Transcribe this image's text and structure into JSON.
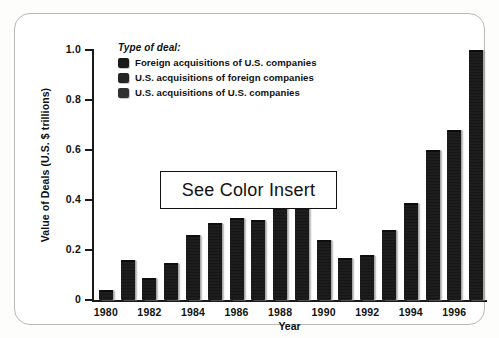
{
  "figure": {
    "legend_title": "Type of deal:",
    "note_overlay": "See Color Insert"
  },
  "legend": {
    "items": [
      {
        "label": "Foreign acquisitions of U.S. companies",
        "swatch": "legend-swatch-foreign-acq-us",
        "color": "#1a1a1a"
      },
      {
        "label": "U.S. acquisitions of foreign companies",
        "swatch": "legend-swatch-us-acq-foreign",
        "color": "#252525"
      },
      {
        "label": "U.S. acquisitions of U.S. companies",
        "swatch": "legend-swatch-us-acq-us",
        "color": "#303030"
      }
    ]
  },
  "chart_data": {
    "type": "bar",
    "title": "",
    "xlabel": "Year",
    "ylabel": "Value of Deals (U.S. $ trillions)",
    "ylim": [
      0,
      1.0
    ],
    "yticks": [
      0,
      0.2,
      0.4,
      0.6,
      0.8,
      1.0
    ],
    "ytick_labels": [
      "0",
      "0.2",
      "0.4",
      "0.6",
      "0.8",
      "1.0"
    ],
    "xtick_labels": [
      "1980",
      "1982",
      "1984",
      "1986",
      "1988",
      "1990",
      "1992",
      "1994",
      "1996"
    ],
    "grid": false,
    "legend_position": "upper-left-inside",
    "categories": [
      "1980",
      "1981",
      "1982",
      "1983",
      "1984",
      "1985",
      "1986",
      "1987",
      "1988",
      "1989",
      "1990",
      "1991",
      "1992",
      "1993",
      "1994",
      "1995",
      "1996",
      "1997"
    ],
    "values": [
      0.04,
      0.16,
      0.09,
      0.15,
      0.26,
      0.31,
      0.33,
      0.32,
      0.38,
      0.38,
      0.24,
      0.17,
      0.18,
      0.28,
      0.39,
      0.6,
      0.68,
      1.0
    ],
    "units": "U.S. $ trillions",
    "bar_color": "#171717"
  }
}
